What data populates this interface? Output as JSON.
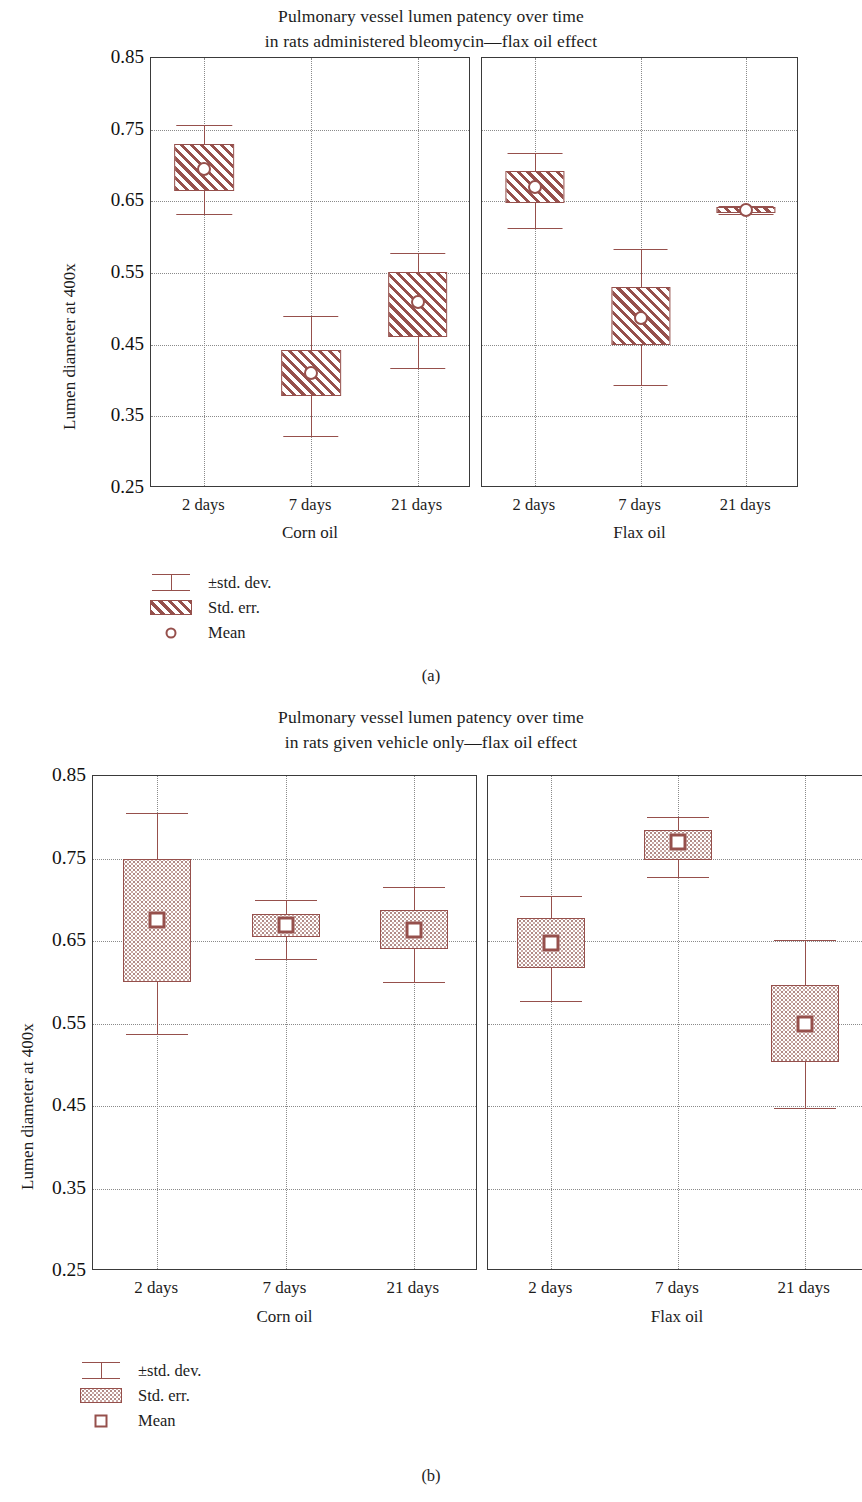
{
  "figure": {
    "subcaption_a": "(a)",
    "subcaption_b": "(b)"
  },
  "colors": {
    "accent": "#96504c",
    "frame": "#3a3a3a",
    "grid": "#8a8a8a",
    "text": "#1c1c1c"
  },
  "chart_data": [
    {
      "id": "chart-a",
      "type": "box",
      "title": "Pulmonary vessel lumen patency over time\nin rats administered bleomycin—flax oil effect",
      "title_line1": "Pulmonary vessel lumen patency over time",
      "title_line2": "in rats administered bleomycin—flax oil effect",
      "subcaption": "(a)",
      "xlabel": "",
      "ylabel": "Lumen diameter at 400x",
      "ylim": [
        0.25,
        0.85
      ],
      "yticks": [
        0.85,
        0.75,
        0.65,
        0.55,
        0.45,
        0.35,
        0.25
      ],
      "ytick_labels": [
        "0.85",
        "0.75",
        "0.65",
        "0.55",
        "0.45",
        "0.35",
        "0.25"
      ],
      "grid": true,
      "categories": [
        "2 days",
        "7 days",
        "21 days"
      ],
      "panels": [
        {
          "name": "Corn oil",
          "boxes": [
            {
              "category": "2 days",
              "mean": 0.695,
              "se_low": 0.665,
              "se_high": 0.73,
              "sd_low": 0.632,
              "sd_high": 0.757
            },
            {
              "category": "7 days",
              "mean": 0.41,
              "se_low": 0.378,
              "se_high": 0.442,
              "sd_low": 0.323,
              "sd_high": 0.49
            },
            {
              "category": "21 days",
              "mean": 0.51,
              "se_low": 0.46,
              "se_high": 0.551,
              "sd_low": 0.418,
              "sd_high": 0.578
            }
          ]
        },
        {
          "name": "Flax oil",
          "boxes": [
            {
              "category": "2 days",
              "mean": 0.67,
              "se_low": 0.648,
              "se_high": 0.692,
              "sd_low": 0.613,
              "sd_high": 0.718
            },
            {
              "category": "7 days",
              "mean": 0.487,
              "se_low": 0.45,
              "se_high": 0.53,
              "sd_low": 0.394,
              "sd_high": 0.583
            },
            {
              "category": "21 days",
              "mean": 0.638,
              "se_low": 0.634,
              "se_high": 0.642,
              "sd_low": 0.632,
              "sd_high": 0.644
            }
          ]
        }
      ],
      "legend": {
        "position": "below-left",
        "entries": [
          {
            "key": "errorbar",
            "label": "±std. dev."
          },
          {
            "key": "hatched-box",
            "label": "Std. err."
          },
          {
            "key": "circle-marker",
            "label": "Mean"
          }
        ]
      }
    },
    {
      "id": "chart-b",
      "type": "box",
      "title": "Pulmonary vessel lumen patency over time\nin rats given vehicle only—flax oil effect",
      "title_line1": "Pulmonary vessel lumen patency over time",
      "title_line2": "in rats given vehicle only—flax oil effect",
      "subcaption": "(b)",
      "xlabel": "",
      "ylabel": "Lumen diameter at 400x",
      "ylim": [
        0.25,
        0.85
      ],
      "yticks": [
        0.85,
        0.75,
        0.65,
        0.55,
        0.45,
        0.35,
        0.25
      ],
      "ytick_labels": [
        "0.85",
        "0.75",
        "0.65",
        "0.55",
        "0.45",
        "0.35",
        "0.25"
      ],
      "grid": true,
      "categories": [
        "2 days",
        "7 days",
        "21 days"
      ],
      "panels": [
        {
          "name": "Corn oil",
          "boxes": [
            {
              "category": "2 days",
              "mean": 0.675,
              "se_low": 0.6,
              "se_high": 0.75,
              "sd_low": 0.537,
              "sd_high": 0.805
            },
            {
              "category": "7 days",
              "mean": 0.67,
              "se_low": 0.655,
              "se_high": 0.683,
              "sd_low": 0.628,
              "sd_high": 0.7
            },
            {
              "category": "21 days",
              "mean": 0.663,
              "se_low": 0.64,
              "se_high": 0.688,
              "sd_low": 0.6,
              "sd_high": 0.715
            }
          ]
        },
        {
          "name": "Flax oil",
          "boxes": [
            {
              "category": "2 days",
              "mean": 0.648,
              "se_low": 0.617,
              "se_high": 0.678,
              "sd_low": 0.577,
              "sd_high": 0.705
            },
            {
              "category": "7 days",
              "mean": 0.77,
              "se_low": 0.748,
              "se_high": 0.785,
              "sd_low": 0.727,
              "sd_high": 0.8
            },
            {
              "category": "21 days",
              "mean": 0.55,
              "se_low": 0.503,
              "se_high": 0.597,
              "sd_low": 0.448,
              "sd_high": 0.651
            }
          ]
        }
      ],
      "legend": {
        "position": "below-left",
        "entries": [
          {
            "key": "errorbar",
            "label": "±std. dev."
          },
          {
            "key": "stippled-box",
            "label": "Std. err."
          },
          {
            "key": "square-marker",
            "label": "Mean"
          }
        ]
      }
    }
  ]
}
